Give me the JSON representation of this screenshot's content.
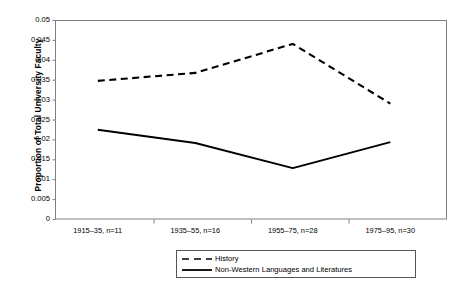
{
  "chart_data": {
    "type": "line",
    "title": "",
    "xlabel": "",
    "ylabel": "Proportion of Total University Faculty",
    "categories": [
      "1915–35, n=11",
      "1935–55, n=16",
      "1955–75, n=28",
      "1975–95, n=30"
    ],
    "series": [
      {
        "name": "History",
        "style": "dashed",
        "values": [
          0.0347,
          0.0367,
          0.044,
          0.029
        ]
      },
      {
        "name": "Non-Western Languages and Literatures",
        "style": "solid",
        "values": [
          0.0224,
          0.0191,
          0.0128,
          0.0193
        ]
      }
    ],
    "ylim": [
      0,
      0.05
    ],
    "ytick_values": [
      0.05,
      0.045,
      0.04,
      0.035,
      0.03,
      0.025,
      0.02,
      0.015,
      0.01,
      0.005,
      0
    ],
    "ytick_labels": [
      "0.05",
      "0.045",
      "0.04",
      "0.035",
      "0.03",
      "0.025",
      "0.02",
      "0.015",
      "0.01",
      "0.005",
      "0"
    ],
    "grid": false,
    "legend_position": "bottom",
    "line_color": "#000000"
  },
  "axis": {
    "y_title": "Proportion of Total University Faculty"
  },
  "legend": {
    "entries": [
      {
        "label": "History",
        "swatch": "dashed-line-swatch"
      },
      {
        "label": "Non-Western Languages and Literatures",
        "swatch": "solid-line-swatch"
      }
    ]
  }
}
